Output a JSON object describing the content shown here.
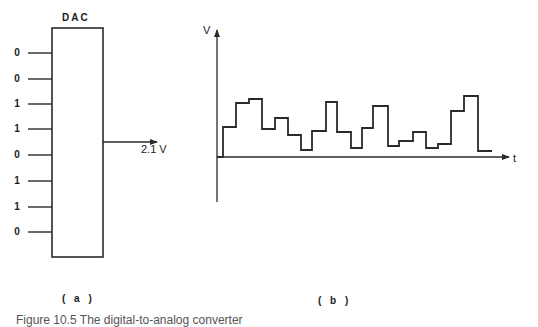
{
  "panel_a": {
    "title": "DAC",
    "panel_label": "( a )",
    "inputs": [
      {
        "bit": "0",
        "y": 53
      },
      {
        "bit": "0",
        "y": 79
      },
      {
        "bit": "1",
        "y": 104
      },
      {
        "bit": "1",
        "y": 129
      },
      {
        "bit": "0",
        "y": 155
      },
      {
        "bit": "1",
        "y": 181
      },
      {
        "bit": "1",
        "y": 207
      },
      {
        "bit": "0",
        "y": 232
      }
    ],
    "output_label": "2.1 V",
    "box": {
      "x": 52,
      "y": 28,
      "w": 51,
      "h": 229
    },
    "output_line": {
      "x1": 103,
      "x2": 157,
      "y": 142
    }
  },
  "panel_b": {
    "y_axis_label": "V",
    "x_axis_label": "t",
    "panel_label": "( b )",
    "axes": {
      "origin_x": 217,
      "baseline_y": 157,
      "top_y": 30,
      "bottom_y": 202,
      "right_x": 509
    },
    "waveform_points": [
      [
        217,
        157
      ],
      [
        223,
        157
      ],
      [
        223,
        127
      ],
      [
        236,
        127
      ],
      [
        236,
        103
      ],
      [
        249,
        103
      ],
      [
        249,
        99
      ],
      [
        262,
        99
      ],
      [
        262,
        129
      ],
      [
        275,
        129
      ],
      [
        275,
        118
      ],
      [
        288,
        118
      ],
      [
        288,
        135
      ],
      [
        301,
        135
      ],
      [
        301,
        150
      ],
      [
        312,
        150
      ],
      [
        312,
        131
      ],
      [
        326,
        131
      ],
      [
        326,
        102
      ],
      [
        337,
        102
      ],
      [
        337,
        132
      ],
      [
        351,
        132
      ],
      [
        351,
        148
      ],
      [
        362,
        148
      ],
      [
        362,
        128
      ],
      [
        373,
        128
      ],
      [
        373,
        106
      ],
      [
        388,
        106
      ],
      [
        388,
        146
      ],
      [
        399,
        146
      ],
      [
        399,
        141
      ],
      [
        413,
        141
      ],
      [
        413,
        132
      ],
      [
        426,
        132
      ],
      [
        426,
        148
      ],
      [
        438,
        148
      ],
      [
        438,
        144
      ],
      [
        451,
        144
      ],
      [
        451,
        111
      ],
      [
        464,
        111
      ],
      [
        464,
        96
      ],
      [
        478,
        96
      ],
      [
        478,
        151
      ],
      [
        492,
        151
      ]
    ]
  },
  "caption": {
    "text": "Figure 10.5 The digital-to-analog converter"
  },
  "colors": {
    "line": "#2a2a2a",
    "background": "#ffffff"
  }
}
